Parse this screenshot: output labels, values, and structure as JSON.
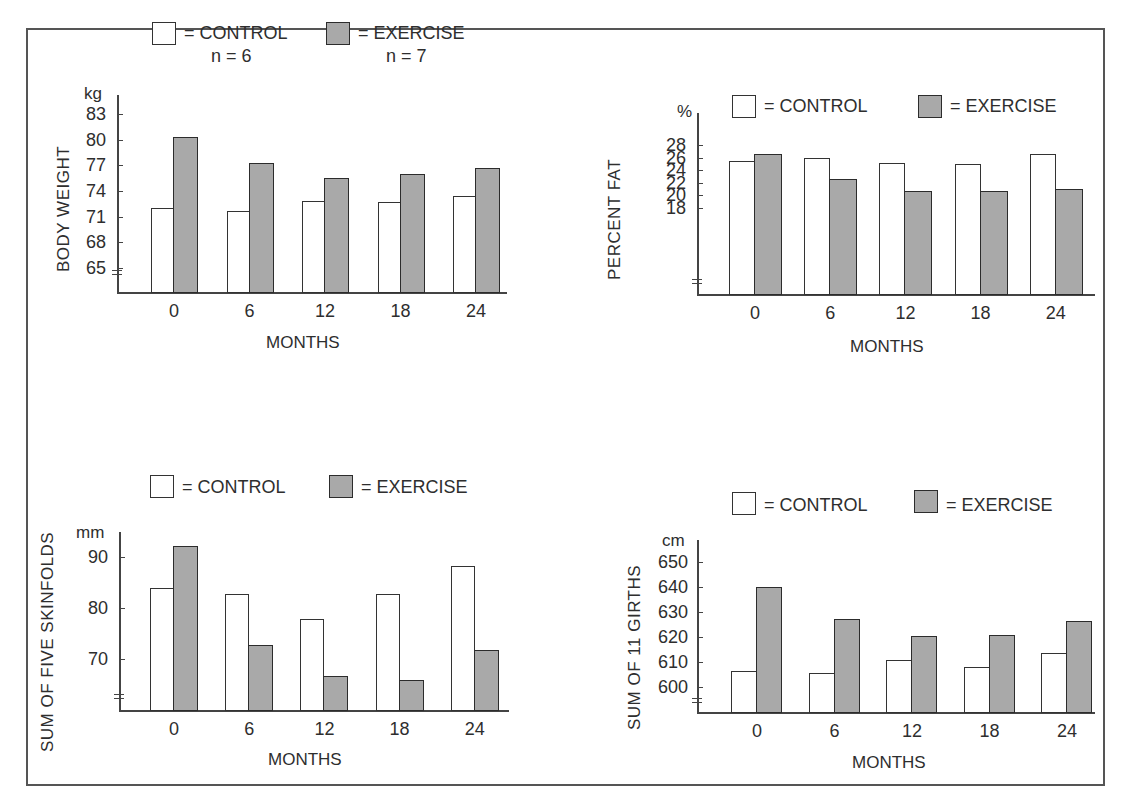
{
  "legend": {
    "control_label": "= CONTROL",
    "exercise_label": "= EXERCISE",
    "control_n": "n = 6",
    "exercise_n": "n = 7",
    "colors": {
      "control": "#ffffff",
      "exercise": "#a9a9a9"
    }
  },
  "chart_data": [
    {
      "type": "bar",
      "title": "",
      "xlabel": "MONTHS",
      "ylabel": "BODY WEIGHT",
      "unit": "kg",
      "categories": [
        "0",
        "6",
        "12",
        "18",
        "24"
      ],
      "yticks": [
        "83",
        "80",
        "77",
        "74",
        "71",
        "68",
        "65"
      ],
      "ylim": [
        62,
        85
      ],
      "legend": [
        "CONTROL (n = 6)",
        "EXERCISE (n = 7)"
      ],
      "series": [
        {
          "name": "CONTROL",
          "values": [
            72.0,
            71.6,
            72.8,
            72.7,
            73.4
          ]
        },
        {
          "name": "EXERCISE",
          "values": [
            80.3,
            77.3,
            75.5,
            76.0,
            76.7
          ]
        }
      ],
      "grid": false,
      "axis_break": true
    },
    {
      "type": "bar",
      "title": "",
      "xlabel": "MONTHS",
      "ylabel": "PERCENT FAT",
      "unit": "%",
      "categories": [
        "0",
        "6",
        "12",
        "18",
        "24"
      ],
      "yticks": [
        "28",
        "26",
        "24",
        "22",
        "20",
        "18"
      ],
      "ylim": [
        16,
        30
      ],
      "legend": [
        "CONTROL",
        "EXERCISE"
      ],
      "series": [
        {
          "name": "CONTROL",
          "values": [
            25.5,
            26.0,
            25.1,
            25.0,
            26.5
          ]
        },
        {
          "name": "EXERCISE",
          "values": [
            26.6,
            22.5,
            20.7,
            20.7,
            21.0
          ]
        }
      ],
      "grid": false,
      "axis_break": true
    },
    {
      "type": "bar",
      "title": "",
      "xlabel": "MONTHS",
      "ylabel": "SUM OF FIVE SKINFOLDS",
      "unit": "mm",
      "categories": [
        "0",
        "6",
        "12",
        "18",
        "24"
      ],
      "yticks": [
        "90",
        "80",
        "70"
      ],
      "ylim": [
        60,
        95
      ],
      "legend": [
        "CONTROL",
        "EXERCISE"
      ],
      "series": [
        {
          "name": "CONTROL",
          "values": [
            83.9,
            82.8,
            77.8,
            82.7,
            88.2
          ]
        },
        {
          "name": "EXERCISE",
          "values": [
            92.2,
            72.8,
            66.7,
            65.9,
            71.8
          ]
        }
      ],
      "grid": false,
      "axis_break": true
    },
    {
      "type": "bar",
      "title": "",
      "xlabel": "MONTHS",
      "ylabel": "SUM OF 11 GIRTHS",
      "unit": "cm",
      "categories": [
        "0",
        "6",
        "12",
        "18",
        "24"
      ],
      "yticks": [
        "650",
        "640",
        "630",
        "620",
        "610",
        "600"
      ],
      "ylim": [
        590,
        660
      ],
      "legend": [
        "CONTROL",
        "EXERCISE"
      ],
      "series": [
        {
          "name": "CONTROL",
          "values": [
            606.4,
            605.5,
            610.7,
            608.1,
            613.6
          ]
        },
        {
          "name": "EXERCISE",
          "values": [
            640.0,
            627.3,
            620.4,
            620.7,
            626.4
          ]
        }
      ],
      "grid": false,
      "axis_break": true
    }
  ]
}
